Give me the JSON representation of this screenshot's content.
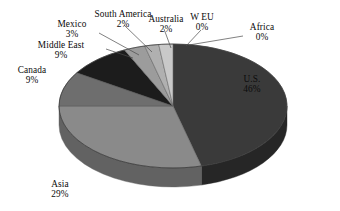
{
  "chart_data": {
    "type": "pie",
    "title": "",
    "subtitle": "",
    "xlabel": "",
    "ylabel": "",
    "legend_position": "none",
    "grid": false,
    "units": "percent",
    "style": "3d-exploded-none",
    "categories": [
      "U.S.",
      "Asia",
      "Canada",
      "Middle East",
      "Mexico",
      "South America",
      "Australia",
      "W EU",
      "Africa"
    ],
    "values": [
      46,
      29,
      9,
      9,
      3,
      2,
      2,
      0,
      0
    ],
    "labels": [
      "46%",
      "29%",
      "9%",
      "9%",
      "3%",
      "2%",
      "2%",
      "0%",
      "0%"
    ],
    "colors": [
      "#3a3a3a",
      "#8a8a8a",
      "#6e6e6e",
      "#1c1c1c",
      "#9c9c9c",
      "#b0b0b0",
      "#c9c9c9",
      "#d8d8d8",
      "#e4e4e4"
    ],
    "slices": [
      {
        "name": "U.S.",
        "value": 46,
        "label": "46%",
        "color": "#3a3a3a",
        "side_color": "#262626"
      },
      {
        "name": "Asia",
        "value": 29,
        "label": "29%",
        "color": "#8a8a8a",
        "side_color": "#626262"
      },
      {
        "name": "Canada",
        "value": 9,
        "label": "9%",
        "color": "#6e6e6e",
        "side_color": "#4e4e4e"
      },
      {
        "name": "Middle East",
        "value": 9,
        "label": "9%",
        "color": "#1c1c1c",
        "side_color": "#141414"
      },
      {
        "name": "Mexico",
        "value": 3,
        "label": "3%",
        "color": "#9c9c9c",
        "side_color": "#6f6f6f"
      },
      {
        "name": "South America",
        "value": 2,
        "label": "2%",
        "color": "#b0b0b0",
        "side_color": "#7d7d7d"
      },
      {
        "name": "Australia",
        "value": 2,
        "label": "2%",
        "color": "#c9c9c9",
        "side_color": "#8f8f8f"
      },
      {
        "name": "W EU",
        "value": 0,
        "label": "0%",
        "color": "#d8d8d8",
        "side_color": "#9a9a9a"
      },
      {
        "name": "Africa",
        "value": 0,
        "label": "0%",
        "color": "#e4e4e4",
        "side_color": "#a4a4a4"
      }
    ]
  },
  "labels": {
    "us": {
      "name": "U.S.",
      "value": "46%"
    },
    "asia": {
      "name": "Asia",
      "value": "29%"
    },
    "canada": {
      "name": "Canada",
      "value": "9%"
    },
    "middle_east": {
      "name": "Middle East",
      "value": "9%"
    },
    "mexico": {
      "name": "Mexico",
      "value": "3%"
    },
    "south_america": {
      "name": "South America",
      "value": "2%"
    },
    "australia": {
      "name": "Australia",
      "value": "2%"
    },
    "w_eu": {
      "name": "W EU",
      "value": "0%"
    },
    "africa": {
      "name": "Africa",
      "value": "0%"
    }
  }
}
